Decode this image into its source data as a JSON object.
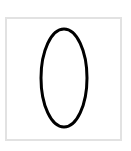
{
  "diagram": {
    "frame": {
      "border_color": "#e2e2e2",
      "background": "#ffffff"
    },
    "shape": {
      "type": "ellipse",
      "cx": 64,
      "cy": 78,
      "rx": 23,
      "ry": 49,
      "stroke": "#000000",
      "stroke_width": 3,
      "fill": "none"
    }
  }
}
